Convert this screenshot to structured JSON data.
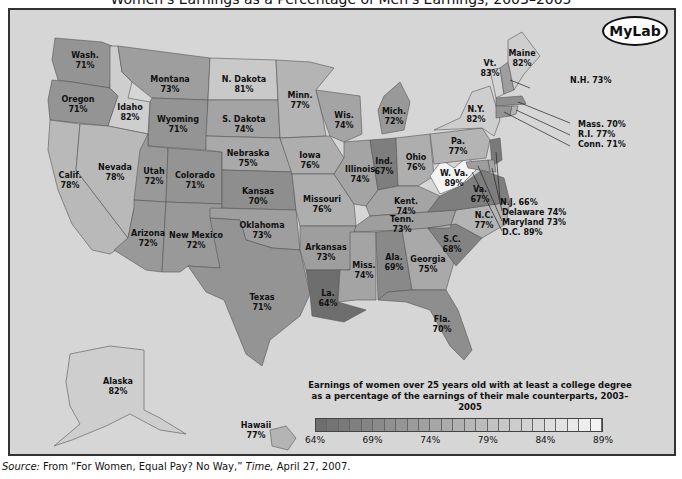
{
  "title": "Women's Earnings as a Percentage of Men's Earnings, 2003–2005",
  "logo": "MyLab",
  "legend": {
    "line1": "Earnings of women over 25 years old with at least a college degree",
    "line2": "as a percentage of the earnings of their male counterparts, 2003–2005",
    "ticks": [
      "64%",
      "69%",
      "74%",
      "79%",
      "84%",
      "89%"
    ],
    "min": 64,
    "max": 89,
    "color_low": "#6e6e6e",
    "color_high": "#f4f4f4"
  },
  "source": {
    "prefix": "Source:",
    "text": " From “For Women, Equal Pay? No Way,” ",
    "publication": "Time,",
    "date": " April 27, 2007."
  },
  "chart_data": {
    "type": "choropleth",
    "title": "Women's Earnings as a Percentage of Men's Earnings, 2003–2005",
    "subtitle": "Earnings of women over 25 years old with at least a college degree as a percentage of the earnings of their male counterparts, 2003–2005",
    "scale": {
      "min": 64,
      "max": 89,
      "ticks": [
        64,
        69,
        74,
        79,
        84,
        89
      ],
      "unit": "%"
    },
    "states": [
      {
        "name": "Wash.",
        "value": 71
      },
      {
        "name": "Oregon",
        "value": 71
      },
      {
        "name": "Calif.",
        "value": 78
      },
      {
        "name": "Idaho",
        "value": 82
      },
      {
        "name": "Nevada",
        "value": 78
      },
      {
        "name": "Montana",
        "value": 73
      },
      {
        "name": "Wyoming",
        "value": 71
      },
      {
        "name": "Utah",
        "value": 72
      },
      {
        "name": "Colorado",
        "value": 71
      },
      {
        "name": "Arizona",
        "value": 72
      },
      {
        "name": "New Mexico",
        "value": 72
      },
      {
        "name": "N. Dakota",
        "value": 81
      },
      {
        "name": "S. Dakota",
        "value": 74
      },
      {
        "name": "Nebraska",
        "value": 75
      },
      {
        "name": "Kansas",
        "value": 70
      },
      {
        "name": "Oklahoma",
        "value": 73
      },
      {
        "name": "Texas",
        "value": 71
      },
      {
        "name": "Minn.",
        "value": 77
      },
      {
        "name": "Iowa",
        "value": 76
      },
      {
        "name": "Missouri",
        "value": 76
      },
      {
        "name": "Arkansas",
        "value": 73
      },
      {
        "name": "La.",
        "value": 64
      },
      {
        "name": "Wis.",
        "value": 74
      },
      {
        "name": "Illinois",
        "value": 74
      },
      {
        "name": "Mich.",
        "value": 72
      },
      {
        "name": "Ind.",
        "value": 67
      },
      {
        "name": "Ohio",
        "value": 76
      },
      {
        "name": "Kent.",
        "value": 74
      },
      {
        "name": "Tenn.",
        "value": 73
      },
      {
        "name": "Miss.",
        "value": 74
      },
      {
        "name": "Ala.",
        "value": 69
      },
      {
        "name": "Georgia",
        "value": 75
      },
      {
        "name": "Fla.",
        "value": 70
      },
      {
        "name": "S.C.",
        "value": 68
      },
      {
        "name": "N.C.",
        "value": 77
      },
      {
        "name": "Va.",
        "value": 67
      },
      {
        "name": "W. Va.",
        "value": 89
      },
      {
        "name": "Pa.",
        "value": 77
      },
      {
        "name": "N.Y.",
        "value": 82
      },
      {
        "name": "Vt.",
        "value": 83
      },
      {
        "name": "Maine",
        "value": 82
      },
      {
        "name": "N.H.",
        "value": 73
      },
      {
        "name": "Mass.",
        "value": 70
      },
      {
        "name": "R.I.",
        "value": 77
      },
      {
        "name": "Conn.",
        "value": 71
      },
      {
        "name": "N.J.",
        "value": 66
      },
      {
        "name": "Delaware",
        "value": 74
      },
      {
        "name": "Maryland",
        "value": 73
      },
      {
        "name": "D.C.",
        "value": 89
      },
      {
        "name": "Alaska",
        "value": 82
      },
      {
        "name": "Hawaii",
        "value": 77
      }
    ]
  },
  "map": {
    "regions": [
      {
        "id": "wa",
        "label": "Wash.",
        "value": 71,
        "pts": "45,28 92,32 102,36 100,78 62,72 48,70 42,50",
        "lx": 75,
        "ly": 48
      },
      {
        "id": "or",
        "label": "Oregon",
        "value": 71,
        "pts": "42,70 62,72 100,78 108,86 98,116 40,110 38,90",
        "lx": 68,
        "ly": 92
      },
      {
        "id": "ca",
        "label": "Calif.",
        "value": 78,
        "pts": "40,110 70,114 66,160 118,228 112,236 100,244 82,240 62,214 48,180 38,140",
        "lx": 60,
        "ly": 168
      },
      {
        "id": "id",
        "label": "Idaho",
        "value": 82,
        "pts": "100,36 108,36 112,62 122,72 118,88 140,92 138,124 98,116 108,86 100,78",
        "lx": 120,
        "ly": 100
      },
      {
        "id": "nv",
        "label": "Nevada",
        "value": 78,
        "pts": "70,114 98,116 138,124 130,190 124,198 118,228 66,160",
        "lx": 105,
        "ly": 160
      },
      {
        "id": "mt",
        "label": "Montana",
        "value": 73,
        "pts": "108,36 200,48 198,90 142,88 122,72 112,62",
        "lx": 160,
        "ly": 72
      },
      {
        "id": "wy",
        "label": "Wyoming",
        "value": 71,
        "pts": "142,88 198,90 196,140 138,136 140,92",
        "lx": 168,
        "ly": 112
      },
      {
        "id": "ut",
        "label": "Utah",
        "value": 72,
        "pts": "138,124 138,136 158,138 156,192 124,190 130,140",
        "lx": 144,
        "ly": 164
      },
      {
        "id": "co",
        "label": "Colorado",
        "value": 71,
        "pts": "158,138 212,142 212,194 156,192",
        "lx": 185,
        "ly": 168
      },
      {
        "id": "az",
        "label": "Arizona",
        "value": 72,
        "pts": "124,190 156,192 152,262 136,260 104,240 118,228 124,198",
        "lx": 138,
        "ly": 226
      },
      {
        "id": "nm",
        "label": "New Mexico",
        "value": 72,
        "pts": "156,192 212,194 210,258 178,256 170,262 152,262",
        "lx": 186,
        "ly": 228
      },
      {
        "id": "nd",
        "label": "N. Dakota",
        "value": 81,
        "pts": "200,48 266,50 268,90 198,90",
        "lx": 234,
        "ly": 72
      },
      {
        "id": "sd",
        "label": "S. Dakota",
        "value": 74,
        "pts": "198,90 268,90 270,128 196,126",
        "lx": 234,
        "ly": 112
      },
      {
        "id": "ne",
        "label": "Nebraska",
        "value": 75,
        "pts": "196,126 270,128 282,162 212,160 212,142 196,140",
        "lx": 238,
        "ly": 146
      },
      {
        "id": "ks",
        "label": "Kansas",
        "value": 70,
        "pts": "212,160 282,162 286,200 212,198",
        "lx": 248,
        "ly": 184
      },
      {
        "id": "ok",
        "label": "Oklahoma",
        "value": 73,
        "pts": "200,198 286,200 290,240 262,238 236,230 230,210 200,208",
        "lx": 252,
        "ly": 218
      },
      {
        "id": "tx",
        "label": "Texas",
        "value": 71,
        "pts": "200,208 230,210 236,230 262,238 290,240 300,284 290,306 260,330 252,356 236,344 214,290 196,282 178,256 210,258",
        "lx": 252,
        "ly": 290
      },
      {
        "id": "mn",
        "label": "Minn.",
        "value": 77,
        "pts": "266,50 300,52 324,58 306,80 312,104 316,126 270,128 268,90",
        "lx": 290,
        "ly": 88
      },
      {
        "id": "ia",
        "label": "Iowa",
        "value": 76,
        "pts": "270,128 320,126 334,148 324,164 282,164",
        "lx": 300,
        "ly": 148
      },
      {
        "id": "mo",
        "label": "Missouri",
        "value": 76,
        "pts": "282,164 324,164 344,194 346,216 290,216 286,200",
        "lx": 312,
        "ly": 192
      },
      {
        "id": "ar",
        "label": "Arkansas",
        "value": 73,
        "pts": "290,216 346,216 340,260 296,260 290,240",
        "lx": 316,
        "ly": 240
      },
      {
        "id": "la",
        "label": "La.",
        "value": 64,
        "pts": "296,260 330,260 328,292 356,300 334,312 302,306 300,284",
        "lx": 318,
        "ly": 286
      },
      {
        "id": "wi",
        "label": "Wis.",
        "value": 74,
        "pts": "306,80 350,86 352,124 334,132 320,126 312,104",
        "lx": 334,
        "ly": 108
      },
      {
        "id": "il",
        "label": "Illinois",
        "value": 74,
        "pts": "334,132 360,130 368,180 356,196 344,194 324,164 334,148",
        "lx": 350,
        "ly": 162
      },
      {
        "id": "mi",
        "label": "Mich.",
        "value": 72,
        "pts": "374,86 390,72 400,92 394,120 372,124 368,100",
        "lx": 384,
        "ly": 104
      },
      {
        "id": "in",
        "label": "Ind.",
        "value": 67,
        "pts": "360,130 386,128 388,176 368,180",
        "lx": 374,
        "ly": 154
      },
      {
        "id": "oh",
        "label": "Ohio",
        "value": 76,
        "pts": "386,128 420,124 424,166 408,176 388,176",
        "lx": 406,
        "ly": 150
      },
      {
        "id": "ky",
        "label": "Kent.",
        "value": 74,
        "pts": "356,196 368,180 388,176 408,176 430,186 418,202 360,206",
        "lx": 396,
        "ly": 194
      },
      {
        "id": "tn",
        "label": "Tenn.",
        "value": 73,
        "pts": "346,216 360,206 418,202 446,200 440,218 344,222",
        "lx": 392,
        "ly": 212
      },
      {
        "id": "ms",
        "label": "Miss.",
        "value": 74,
        "pts": "340,222 366,222 366,290 346,290 328,292 330,260 340,260",
        "lx": 354,
        "ly": 258
      },
      {
        "id": "al",
        "label": "Ala.",
        "value": 69,
        "pts": "366,222 392,220 402,280 378,282 368,290",
        "lx": 384,
        "ly": 250
      },
      {
        "id": "ga",
        "label": "Georgia",
        "value": 75,
        "pts": "392,220 418,218 444,252 436,280 402,280",
        "lx": 418,
        "ly": 252
      },
      {
        "id": "fl",
        "label": "Fla.",
        "value": 70,
        "pts": "368,290 378,282 402,280 436,280 448,300 462,340 454,350 440,336 420,300 396,292",
        "lx": 432,
        "ly": 312
      },
      {
        "id": "sc",
        "label": "S.C.",
        "value": 68,
        "pts": "418,218 446,214 472,228 446,256",
        "lx": 442,
        "ly": 232
      },
      {
        "id": "nc",
        "label": "N.C.",
        "value": 77,
        "pts": "418,218 440,218 446,200 500,192 496,214 472,228 446,214",
        "lx": 474,
        "ly": 208
      },
      {
        "id": "va",
        "label": "Va.",
        "value": 67,
        "pts": "418,202 430,186 450,176 472,160 494,168 500,192 446,200",
        "lx": 470,
        "ly": 182
      },
      {
        "id": "wv",
        "label": "W. Va.",
        "value": 89,
        "pts": "420,166 432,150 444,158 456,148 470,156 450,176 430,184",
        "lx": 444,
        "ly": 166
      },
      {
        "id": "pa",
        "label": "Pa.",
        "value": 77,
        "pts": "420,124 472,118 480,130 476,148 424,154",
        "lx": 448,
        "ly": 134
      },
      {
        "id": "ny",
        "label": "N.Y.",
        "value": 82,
        "pts": "424,120 450,108 462,82 480,76 490,110 484,126 472,118",
        "lx": 466,
        "ly": 102
      },
      {
        "id": "vt",
        "label": "Vt.",
        "value": 83,
        "pts": "480,60 490,58 494,84 486,88",
        "lx": 480,
        "ly": 56
      },
      {
        "id": "nh",
        "label": "N.H.",
        "value": 73,
        "pts": "490,58 498,52 504,80 494,84",
        "lx": 0,
        "ly": 0
      },
      {
        "id": "me",
        "label": "Maine",
        "value": 82,
        "pts": "498,30 512,22 530,46 514,64 504,80 498,52",
        "lx": 512,
        "ly": 46
      },
      {
        "id": "ma",
        "label": "Mass.",
        "value": 70,
        "pts": "486,88 512,86 516,94 486,96",
        "lx": 0,
        "ly": 0
      },
      {
        "id": "ct",
        "label": "Conn.",
        "value": 71,
        "pts": "486,96 502,96 500,106 486,108",
        "lx": 0,
        "ly": 0
      },
      {
        "id": "ri",
        "label": "R.I.",
        "value": 77,
        "pts": "502,96 508,96 506,104 500,106",
        "lx": 0,
        "ly": 0
      },
      {
        "id": "nj",
        "label": "N.J.",
        "value": 66,
        "pts": "480,130 490,128 492,150 482,156",
        "lx": 0,
        "ly": 0
      },
      {
        "id": "de",
        "label": "Delaware",
        "value": 74,
        "pts": "478,150 484,150 486,162 480,162",
        "lx": 0,
        "ly": 0
      },
      {
        "id": "md",
        "label": "Maryland",
        "value": 73,
        "pts": "456,152 478,150 480,162 470,160 458,158",
        "lx": 0,
        "ly": 0
      },
      {
        "id": "ak",
        "label": "Alaska",
        "value": 82,
        "pts": "60,344 100,336 134,340 134,400 150,408 176,424 150,420 120,404 96,416 62,430 44,436 70,414 60,396 56,372",
        "lx": 108,
        "ly": 374
      },
      {
        "id": "hi",
        "label": "Hawaii",
        "value": 77,
        "pts": "260,420 276,416 286,428 278,440 262,436",
        "lx": 246,
        "ly": 418
      }
    ],
    "callouts": [
      {
        "text": "N.H. 73%",
        "x": 560,
        "y": 73,
        "lx": 520,
        "ly": 78,
        "tx": 500,
        "ty": 70
      },
      {
        "text": "Mass. 70%",
        "x": 568,
        "y": 117,
        "lx": 560,
        "ly": 113,
        "tx": 508,
        "ty": 92
      },
      {
        "text": "R.I. 77%",
        "x": 568,
        "y": 127,
        "lx": 560,
        "ly": 125,
        "tx": 506,
        "ty": 100
      },
      {
        "text": "Conn. 71%",
        "x": 568,
        "y": 137,
        "lx": 560,
        "ly": 136,
        "tx": 494,
        "ty": 102
      },
      {
        "text": "N.J. 66%",
        "x": 490,
        "y": 195,
        "lx": 490,
        "ly": 190,
        "tx": 486,
        "ty": 142
      },
      {
        "text": "Delaware 74%",
        "x": 492,
        "y": 205,
        "lx": 492,
        "ly": 201,
        "tx": 482,
        "ty": 158
      },
      {
        "text": "Maryland 73%",
        "x": 492,
        "y": 215,
        "lx": 492,
        "ly": 211,
        "tx": 468,
        "ty": 156
      },
      {
        "text": "D.C. 89%",
        "x": 492,
        "y": 225,
        "lx": 492,
        "ly": 221,
        "tx": 462,
        "ty": 162
      }
    ]
  }
}
